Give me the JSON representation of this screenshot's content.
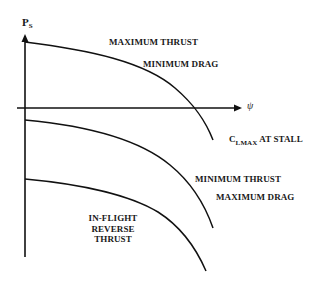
{
  "diagram": {
    "y_axis": {
      "label_main": "P",
      "label_sub": "S"
    },
    "x_axis": {
      "label": "ψ"
    },
    "curves": [
      {
        "id": "max-thrust",
        "labels": [
          "MAXIMUM THRUST",
          "MINIMUM DRAG"
        ]
      },
      {
        "id": "min-thrust",
        "labels": [
          "MINIMUM THRUST",
          "MAXIMUM DRAG"
        ]
      },
      {
        "id": "reverse-thrust",
        "labels": [
          "IN-FLIGHT",
          "REVERSE",
          "THRUST"
        ]
      }
    ],
    "annotations": {
      "stall": {
        "main": "C",
        "sub": "LMAX",
        "suffix": " AT STALL"
      }
    },
    "colors": {
      "line": "#111111",
      "background": "#ffffff"
    }
  }
}
